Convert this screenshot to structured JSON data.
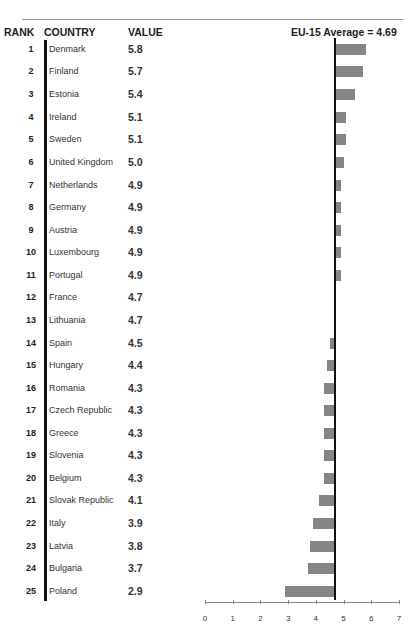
{
  "chart_data": {
    "type": "bar",
    "orientation": "horizontal",
    "title": "",
    "columns": [
      "RANK",
      "COUNTRY",
      "VALUE"
    ],
    "reference_line": {
      "label": "EU-15 Average = 4.69",
      "value": 4.69
    },
    "categories": [
      "Denmark",
      "Finland",
      "Estonia",
      "Ireland",
      "Sweden",
      "United Kingdom",
      "Netherlands",
      "Germany",
      "Austria",
      "Luxembourg",
      "Portugal",
      "France",
      "Lithuania",
      "Spain",
      "Hungary",
      "Romania",
      "Czech Republic",
      "Greece",
      "Slovenia",
      "Belgium",
      "Slovak Republic",
      "Italy",
      "Latvia",
      "Bulgaria",
      "Poland"
    ],
    "ranks": [
      1,
      2,
      3,
      4,
      5,
      6,
      7,
      8,
      9,
      10,
      11,
      12,
      13,
      14,
      15,
      16,
      17,
      18,
      19,
      20,
      21,
      22,
      23,
      24,
      25
    ],
    "values": [
      5.8,
      5.7,
      5.4,
      5.1,
      5.1,
      5.0,
      4.9,
      4.9,
      4.9,
      4.9,
      4.9,
      4.7,
      4.7,
      4.5,
      4.4,
      4.3,
      4.3,
      4.3,
      4.3,
      4.3,
      4.1,
      3.9,
      3.8,
      3.7,
      2.9
    ],
    "xlim": [
      0,
      7
    ],
    "xticks": [
      0,
      1,
      2,
      3,
      4,
      5,
      6,
      7
    ],
    "xlabel": "",
    "ylabel": "",
    "bar_color": "#858585",
    "grid": false
  },
  "header": {
    "rank": "RANK",
    "country": "COUNTRY",
    "value": "VALUE",
    "average": "EU-15 Average = 4.69"
  },
  "rows": [
    {
      "rank": "1",
      "country": "Denmark",
      "value": "5.8"
    },
    {
      "rank": "2",
      "country": "Finland",
      "value": "5.7"
    },
    {
      "rank": "3",
      "country": "Estonia",
      "value": "5.4"
    },
    {
      "rank": "4",
      "country": "Ireland",
      "value": "5.1"
    },
    {
      "rank": "5",
      "country": "Sweden",
      "value": "5.1"
    },
    {
      "rank": "6",
      "country": "United Kingdom",
      "value": "5.0"
    },
    {
      "rank": "7",
      "country": "Netherlands",
      "value": "4.9"
    },
    {
      "rank": "8",
      "country": "Germany",
      "value": "4.9"
    },
    {
      "rank": "9",
      "country": "Austria",
      "value": "4.9"
    },
    {
      "rank": "10",
      "country": "Luxembourg",
      "value": "4.9"
    },
    {
      "rank": "11",
      "country": "Portugal",
      "value": "4.9"
    },
    {
      "rank": "12",
      "country": "France",
      "value": "4.7"
    },
    {
      "rank": "13",
      "country": "Lithuania",
      "value": "4.7"
    },
    {
      "rank": "14",
      "country": "Spain",
      "value": "4.5"
    },
    {
      "rank": "15",
      "country": "Hungary",
      "value": "4.4"
    },
    {
      "rank": "16",
      "country": "Romania",
      "value": "4.3"
    },
    {
      "rank": "17",
      "country": "Czech Republic",
      "value": "4.3"
    },
    {
      "rank": "18",
      "country": "Greece",
      "value": "4.3"
    },
    {
      "rank": "19",
      "country": "Slovenia",
      "value": "4.3"
    },
    {
      "rank": "20",
      "country": "Belgium",
      "value": "4.3"
    },
    {
      "rank": "21",
      "country": "Slovak Republic",
      "value": "4.1"
    },
    {
      "rank": "22",
      "country": "Italy",
      "value": "3.9"
    },
    {
      "rank": "23",
      "country": "Latvia",
      "value": "3.8"
    },
    {
      "rank": "24",
      "country": "Bulgaria",
      "value": "3.7"
    },
    {
      "rank": "25",
      "country": "Poland",
      "value": "2.9"
    }
  ],
  "axis": {
    "ticks": [
      "0",
      "1",
      "2",
      "3",
      "4",
      "5",
      "6",
      "7"
    ]
  }
}
